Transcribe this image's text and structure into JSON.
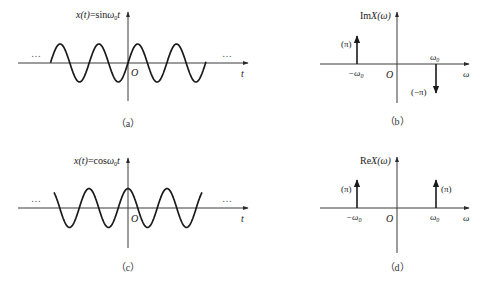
{
  "panels": {
    "a": {
      "caption": "（a）",
      "title_prefix": "x(t)",
      "title_eq": "=sin",
      "title_omega": "ω",
      "title_sub": "0",
      "title_t": "t",
      "origin": "O",
      "x_axis": "t",
      "ellipsis_left": "…",
      "ellipsis_right": "…"
    },
    "b": {
      "caption": "（b）",
      "title_prefix": "Im",
      "title_fn": "X(ω)",
      "origin": "O",
      "x_axis": "ω",
      "neg_freq_label": "−ω",
      "neg_freq_sub": "0",
      "pos_freq_label": "ω",
      "pos_freq_sub": "0",
      "neg_impulse_weight": "(π)",
      "pos_impulse_weight": "(−π)"
    },
    "c": {
      "caption": "（c）",
      "title_prefix": "x(t)",
      "title_eq": "=cos",
      "title_omega": "ω",
      "title_sub": "0",
      "title_t": "t",
      "origin": "O",
      "x_axis": "t",
      "ellipsis_left": "…",
      "ellipsis_right": "…"
    },
    "d": {
      "caption": "（d）",
      "title_prefix": "Re",
      "title_fn": "X(ω)",
      "origin": "O",
      "x_axis": "ω",
      "neg_freq_label": "−ω",
      "neg_freq_sub": "0",
      "pos_freq_label": "ω",
      "pos_freq_sub": "0",
      "neg_impulse_weight": "(π)",
      "pos_impulse_weight": "(π)"
    }
  },
  "chart_data": [
    {
      "type": "line",
      "title": "x(t)=sinω0t",
      "xlabel": "t",
      "ylabel": "x(t)",
      "function": "sin",
      "periods_shown": 4,
      "amplitude": 1,
      "continues_both_directions": true
    },
    {
      "type": "impulse",
      "title": "ImX(ω)",
      "xlabel": "ω",
      "x": [
        "-ω0",
        "ω0"
      ],
      "values": [
        "π",
        "-π"
      ]
    },
    {
      "type": "line",
      "title": "x(t)=cosω0t",
      "xlabel": "t",
      "ylabel": "x(t)",
      "function": "cos",
      "periods_shown": 4,
      "amplitude": 1,
      "continues_both_directions": true
    },
    {
      "type": "impulse",
      "title": "ReX(ω)",
      "xlabel": "ω",
      "x": [
        "-ω0",
        "ω0"
      ],
      "values": [
        "π",
        "π"
      ]
    }
  ]
}
